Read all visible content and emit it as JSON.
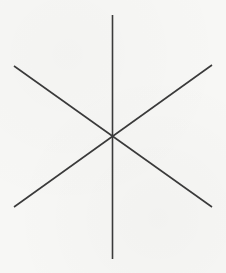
{
  "diagram": {
    "type": "asterisk-star",
    "center": {
      "x": 112.5,
      "y": 135.5
    },
    "stroke_color": "#3a3a3a",
    "stroke_width": 1.6,
    "background_color": "#f7f7f5",
    "lines": [
      {
        "name": "vertical-line",
        "x1": 112.5,
        "y1": 15,
        "x2": 112.5,
        "y2": 259
      },
      {
        "name": "diagonal-line-1",
        "x1": 14,
        "y1": 66,
        "x2": 212,
        "y2": 207
      },
      {
        "name": "diagonal-line-2",
        "x1": 212,
        "y1": 65,
        "x2": 14,
        "y2": 207
      }
    ]
  }
}
